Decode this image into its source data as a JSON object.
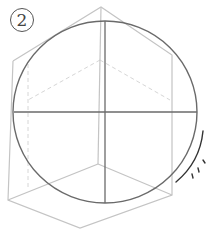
{
  "figure": {
    "step_label": "2",
    "colors": {
      "cube": "#c8c8c8",
      "circle": "#6a6a6a",
      "dashed": "#d8d8d8",
      "marks": "#333333"
    }
  }
}
